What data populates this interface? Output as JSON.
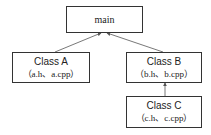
{
  "diagram": {
    "nodes": {
      "main": {
        "label": "main"
      },
      "class_a": {
        "title": "Class A",
        "files": "（a.h、a.cpp）"
      },
      "class_b": {
        "title": "Class B",
        "files": "（b.h、b.cpp）"
      },
      "class_c": {
        "title": "Class C",
        "files": "（c.h、c.cpp）"
      }
    },
    "edges": [
      {
        "from": "Class A",
        "to": "main"
      },
      {
        "from": "Class B",
        "to": "main"
      },
      {
        "from": "Class C",
        "to": "Class B"
      }
    ],
    "colors": {
      "stroke": "#333333",
      "text": "#222222",
      "background": "#ffffff"
    }
  }
}
